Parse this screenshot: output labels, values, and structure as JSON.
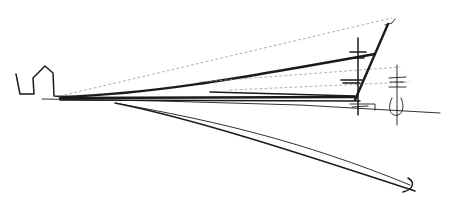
{
  "sketch": {
    "subject": "hand-drawn architectural perspective sketch",
    "ink_color": "#1a1a1a",
    "background": "#ffffff",
    "elements": [
      "building-outline",
      "horizon-line",
      "converging-roof-lines",
      "inclined-mast",
      "vertical-posts",
      "curved-ground-line",
      "end-arc"
    ]
  }
}
